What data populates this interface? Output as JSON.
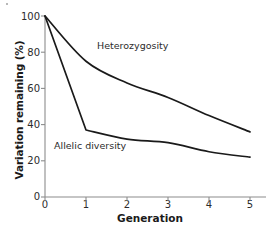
{
  "figure": {
    "speck_name": "scan-artifact-dot"
  },
  "axes": {
    "ylabel": "Variation remaining (%)",
    "xlabel": "Generation",
    "yticks": [
      "0",
      "20",
      "40",
      "60",
      "80",
      "100"
    ],
    "xticks": [
      "0",
      "1",
      "2",
      "3",
      "4",
      "5"
    ],
    "axis_color": "#8c8c8c",
    "line_color": "#1a1a1a"
  },
  "labels": {
    "heterozygosity": "Heterozygosity",
    "allelic_diversity": "Allelic diversity"
  },
  "chart_data": {
    "type": "line",
    "title": "",
    "xlabel": "Generation",
    "ylabel": "Variation remaining (%)",
    "x": [
      0,
      1,
      2,
      3,
      4,
      5
    ],
    "xlim": [
      0,
      5.2
    ],
    "ylim": [
      0,
      100
    ],
    "xticks": [
      0,
      1,
      2,
      3,
      4,
      5
    ],
    "yticks": [
      0,
      20,
      40,
      60,
      80,
      100
    ],
    "grid": false,
    "legend": "inline-annotations",
    "series": [
      {
        "name": "Heterozygosity",
        "values": [
          100,
          75,
          63,
          55,
          45,
          36
        ],
        "color": "#1a1a1a"
      },
      {
        "name": "Allelic diversity",
        "values": [
          100,
          37,
          32,
          30,
          25,
          22
        ],
        "color": "#1a1a1a"
      }
    ],
    "annotations": [
      {
        "text": "Heterozygosity",
        "x": 2.0,
        "y": 79
      },
      {
        "text": "Allelic diversity",
        "x": 0.5,
        "y": 25
      }
    ]
  }
}
